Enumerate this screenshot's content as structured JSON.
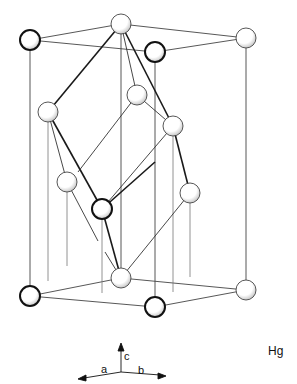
{
  "title": "Hg",
  "axes": {
    "a": "a",
    "b": "b",
    "c": "c"
  },
  "colors": {
    "line": "#222222",
    "thin_line": "#555555",
    "atom_fill": "#ffffff"
  },
  "atoms": [
    {
      "id": "top-left-front",
      "x": 30,
      "y": 40,
      "r": 10,
      "bold": true
    },
    {
      "id": "top-back",
      "x": 121,
      "y": 24,
      "r": 10,
      "bold": false
    },
    {
      "id": "top-right-front",
      "x": 155,
      "y": 52,
      "r": 10,
      "bold": true
    },
    {
      "id": "top-right-back",
      "x": 246,
      "y": 38,
      "r": 10,
      "bold": false
    },
    {
      "id": "upper-left",
      "x": 48,
      "y": 112,
      "r": 10,
      "bold": false
    },
    {
      "id": "upper-inner",
      "x": 137,
      "y": 95,
      "r": 10,
      "bold": false
    },
    {
      "id": "upper-right",
      "x": 173,
      "y": 126,
      "r": 10,
      "bold": false
    },
    {
      "id": "lower-left",
      "x": 67,
      "y": 182,
      "r": 10,
      "bold": false
    },
    {
      "id": "lower-center",
      "x": 102,
      "y": 209,
      "r": 10,
      "bold": true
    },
    {
      "id": "lower-right",
      "x": 190,
      "y": 193,
      "r": 10,
      "bold": false
    },
    {
      "id": "bottom-back",
      "x": 121,
      "y": 278,
      "r": 10,
      "bold": false
    },
    {
      "id": "bottom-left-front",
      "x": 30,
      "y": 296,
      "r": 10,
      "bold": true
    },
    {
      "id": "bottom-right-front",
      "x": 155,
      "y": 307,
      "r": 10,
      "bold": true
    },
    {
      "id": "bottom-right-back",
      "x": 246,
      "y": 290,
      "r": 10,
      "bold": false
    }
  ]
}
